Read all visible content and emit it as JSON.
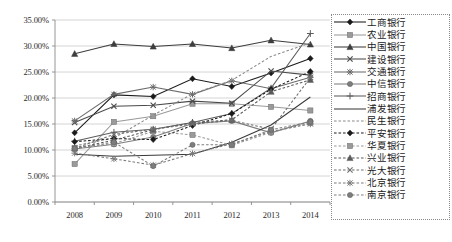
{
  "chart_data": {
    "type": "line",
    "title": "",
    "xlabel": "",
    "ylabel": "",
    "categories": [
      "2008",
      "2009",
      "2010",
      "2011",
      "2012",
      "2013",
      "2014"
    ],
    "x_tick_labels": [
      "2008",
      "2009",
      "2010",
      "2011",
      "2012",
      "2013",
      "2014"
    ],
    "y_tick_labels": [
      "0.00%",
      "5.00%",
      "10.00%",
      "15.00%",
      "20.00%",
      "25.00%",
      "30.00%",
      "35.00%"
    ],
    "y_tick_values": [
      0,
      5,
      10,
      15,
      20,
      25,
      30,
      35
    ],
    "ylim": [
      0,
      35
    ],
    "grid": "horizontal",
    "legend_position": "right",
    "value_unit": "percent",
    "series": [
      {
        "name": "工商银行",
        "marker": "diamond",
        "dash": "solid",
        "color": "#1a1a1a",
        "values": [
          13.3,
          20.6,
          20.3,
          23.7,
          22.2,
          24.8,
          27.6
        ]
      },
      {
        "name": "农业银行",
        "marker": "square",
        "dash": "solid",
        "color": "#9a9a9a",
        "values": [
          7.3,
          15.4,
          16.5,
          18.9,
          18.9,
          18.3,
          17.6
        ]
      },
      {
        "name": "中国银行",
        "marker": "triangle",
        "dash": "solid",
        "color": "#3d3d3d",
        "values": [
          28.5,
          30.4,
          29.9,
          30.4,
          29.6,
          31.1,
          30.3
        ]
      },
      {
        "name": "建设银行",
        "marker": "x",
        "dash": "solid",
        "color": "#4a4a4a",
        "values": [
          15.3,
          18.4,
          18.6,
          19.4,
          19.0,
          25.2,
          24.4
        ]
      },
      {
        "name": "交通银行",
        "marker": "asterisk",
        "dash": "solid",
        "color": "#6b6b6b",
        "values": [
          15.6,
          20.7,
          22.1,
          20.7,
          23.3,
          21.8,
          24.0
        ]
      },
      {
        "name": "中信银行",
        "marker": "circle",
        "dash": "solid",
        "color": "#7d7d7d",
        "values": [
          10.2,
          11.1,
          12.5,
          15.1,
          15.6,
          13.3,
          15.6
        ]
      },
      {
        "name": "招商银行",
        "marker": "plus",
        "dash": "solid",
        "color": "#5c5c5c",
        "values": [
          11.7,
          13.4,
          14.0,
          15.3,
          17.0,
          21.9,
          32.4
        ]
      },
      {
        "name": "浦发银行",
        "marker": "none",
        "dash": "solid",
        "color": "#3a3a3a",
        "values": [
          9.2,
          8.8,
          9.0,
          9.2,
          11.5,
          14.8,
          20.2
        ]
      },
      {
        "name": "民生银行",
        "marker": "none",
        "dash": "dashed",
        "color": "#8a8a8a",
        "values": [
          10.8,
          12.3,
          16.7,
          20.8,
          23.4,
          28.0,
          30.6
        ]
      },
      {
        "name": "平安银行",
        "marker": "diamond",
        "dash": "dashed",
        "color": "#1a1a1a",
        "values": [
          11.6,
          12.2,
          12.0,
          14.7,
          17.0,
          21.7,
          25.1
        ]
      },
      {
        "name": "华夏银行",
        "marker": "square",
        "dash": "dashed",
        "color": "#9a9a9a",
        "values": [
          10.4,
          11.2,
          13.6,
          12.9,
          10.9,
          13.4,
          15.2
        ]
      },
      {
        "name": "兴业银行",
        "marker": "triangle",
        "dash": "dashed",
        "color": "#5a5a5a",
        "values": [
          10.3,
          11.9,
          13.9,
          15.3,
          15.8,
          21.2,
          23.5
        ]
      },
      {
        "name": "光大银行",
        "marker": "x",
        "dash": "dashed",
        "color": "#6e6e6e",
        "values": [
          10.3,
          13.0,
          14.0,
          15.0,
          15.7,
          14.0,
          23.9
        ]
      },
      {
        "name": "北京银行",
        "marker": "asterisk",
        "dash": "dashed",
        "color": "#7a7a7a",
        "values": [
          9.4,
          8.3,
          7.1,
          9.3,
          11.2,
          13.6,
          15.0
        ]
      },
      {
        "name": "南京银行",
        "marker": "circle",
        "dash": "dashed",
        "color": "#7d7d7d",
        "values": [
          10.3,
          11.5,
          6.9,
          11.0,
          11.0,
          13.9,
          15.4
        ]
      }
    ],
    "legend_entries": [
      {
        "label": "工商银行",
        "marker": "diamond",
        "dash": "solid",
        "color": "#1a1a1a"
      },
      {
        "label": "农业银行",
        "marker": "square",
        "dash": "solid",
        "color": "#9a9a9a"
      },
      {
        "label": "中国银行",
        "marker": "triangle",
        "dash": "solid",
        "color": "#3d3d3d"
      },
      {
        "label": "建设银行",
        "marker": "x",
        "dash": "solid",
        "color": "#4a4a4a"
      },
      {
        "label": "交通银行",
        "marker": "asterisk",
        "dash": "solid",
        "color": "#6b6b6b"
      },
      {
        "label": "中信银行",
        "marker": "circle",
        "dash": "solid",
        "color": "#7d7d7d"
      },
      {
        "label": "招商银行",
        "marker": "plus",
        "dash": "solid",
        "color": "#5c5c5c"
      },
      {
        "label": "浦发银行",
        "marker": "none",
        "dash": "solid",
        "color": "#3a3a3a"
      },
      {
        "label": "民生银行",
        "marker": "none",
        "dash": "dashed",
        "color": "#8a8a8a"
      },
      {
        "label": "平安银行",
        "marker": "diamond",
        "dash": "dashed",
        "color": "#1a1a1a"
      },
      {
        "label": "华夏银行",
        "marker": "square",
        "dash": "dashed",
        "color": "#9a9a9a"
      },
      {
        "label": "兴业银行",
        "marker": "triangle",
        "dash": "dashed",
        "color": "#5a5a5a"
      },
      {
        "label": "光大银行",
        "marker": "x",
        "dash": "dashed",
        "color": "#6e6e6e"
      },
      {
        "label": "北京银行",
        "marker": "asterisk",
        "dash": "dashed",
        "color": "#7a7a7a"
      },
      {
        "label": "南京银行",
        "marker": "circle",
        "dash": "dashed",
        "color": "#7d7d7d"
      }
    ],
    "colors": {
      "grid": "#c9c9c9",
      "axis": "#8a8a8a",
      "text": "#2b2b2b",
      "legend_border": "#8a8a8a"
    }
  }
}
